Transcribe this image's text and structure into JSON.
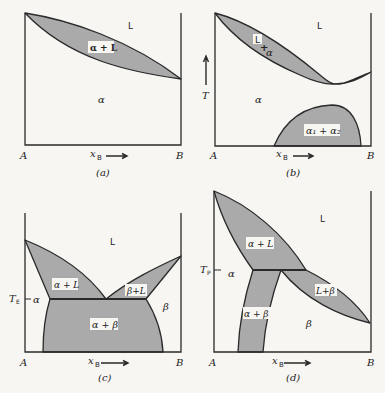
{
  "figure": {
    "panels": [
      {
        "id": "a",
        "caption": "(a)",
        "x_axis": {
          "left": "A",
          "right": "B",
          "label": "x",
          "label_sub": "B"
        },
        "regions": {
          "liquid": "L",
          "two_phase": "α + L",
          "solid": "α"
        }
      },
      {
        "id": "b",
        "caption": "(b)",
        "x_axis": {
          "left": "A",
          "right": "B",
          "label": "x",
          "label_sub": "B"
        },
        "y_axis": {
          "label": "T"
        },
        "regions": {
          "liquid": "L",
          "two_phase_top": "L",
          "two_phase_plus": "+",
          "two_phase_bottom": "α",
          "solid": "α",
          "miscibility_gap": "α₁ + α₂"
        }
      },
      {
        "id": "c",
        "caption": "(c)",
        "x_axis": {
          "left": "A",
          "right": "B",
          "label": "x",
          "label_sub": "B"
        },
        "y_marker": {
          "label": "T",
          "label_sub": "E"
        },
        "regions": {
          "liquid": "L",
          "alpha_liquid": "α + L",
          "beta_liquid": "β+L",
          "alpha": "α",
          "beta": "β",
          "alpha_beta": "α + β"
        }
      },
      {
        "id": "d",
        "caption": "(d)",
        "x_axis": {
          "left": "A",
          "right": "B",
          "label": "x",
          "label_sub": "B"
        },
        "y_marker": {
          "label": "T",
          "label_sub": "P"
        },
        "regions": {
          "liquid": "L",
          "alpha_liquid": "α + L",
          "liquid_beta": "L+β",
          "alpha": "α",
          "beta": "β",
          "alpha_beta": "α + β"
        }
      }
    ]
  }
}
